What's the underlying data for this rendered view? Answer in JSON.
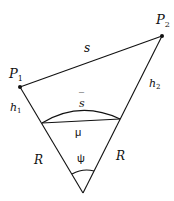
{
  "diagram": {
    "type": "geometry",
    "labels": {
      "p1": "P",
      "p1_sub": "1",
      "p2": "P",
      "p2_sub": "2",
      "s": "s",
      "s_bar": "s",
      "s_bar_accent": "¯",
      "h1": "h",
      "h1_sub": "1",
      "h2": "h",
      "h2_sub": "2",
      "mu": "μ",
      "r_left": "R",
      "r_right": "R",
      "psi": "ψ"
    },
    "colors": {
      "stroke": "#111111",
      "background": "#ffffff"
    }
  }
}
